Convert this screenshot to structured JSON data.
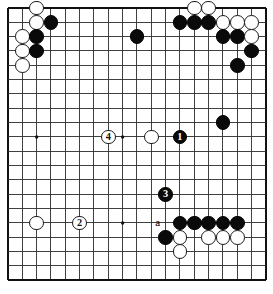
{
  "app": {
    "title": "Go board diagram",
    "type": "go-game-diagram"
  },
  "board": {
    "columns": 19,
    "rows": 20,
    "origin_x": 8,
    "origin_y": 8,
    "spacing": 14.33,
    "line_color": "#2b2b2b",
    "border_color": "#111111",
    "background_color": "#ffffff",
    "star_points": [
      {
        "col": 3,
        "row": 10
      },
      {
        "col": 9,
        "row": 10
      },
      {
        "col": 9,
        "row": 16
      }
    ]
  },
  "colors": {
    "black_stone": "#0a0a0a",
    "white_stone": "#ffffff",
    "stone_outline": "#1a1a1a",
    "label_on_black": "#ffffff",
    "label_on_white": "#111111"
  },
  "stones": [
    {
      "id": "w-c3r1",
      "color": "white",
      "col": 3,
      "row": 1,
      "label": ""
    },
    {
      "id": "w-c3r2",
      "color": "white",
      "col": 3,
      "row": 2,
      "label": ""
    },
    {
      "id": "b-c4r2",
      "color": "black",
      "col": 4,
      "row": 2,
      "label": ""
    },
    {
      "id": "w-c2r3",
      "color": "white",
      "col": 2,
      "row": 3,
      "label": ""
    },
    {
      "id": "b-c3r3",
      "color": "black",
      "col": 3,
      "row": 3,
      "label": ""
    },
    {
      "id": "w-c2r4",
      "color": "white",
      "col": 2,
      "row": 4,
      "label": ""
    },
    {
      "id": "b-c3r4",
      "color": "black",
      "col": 3,
      "row": 4,
      "label": ""
    },
    {
      "id": "w-c2r5",
      "color": "white",
      "col": 2,
      "row": 5,
      "label": ""
    },
    {
      "id": "b-c10r3",
      "color": "black",
      "col": 10,
      "row": 3,
      "label": ""
    },
    {
      "id": "w-c14r1",
      "color": "white",
      "col": 14,
      "row": 1,
      "label": ""
    },
    {
      "id": "w-c15r1",
      "color": "white",
      "col": 15,
      "row": 1,
      "label": ""
    },
    {
      "id": "b-c13r2",
      "color": "black",
      "col": 13,
      "row": 2,
      "label": ""
    },
    {
      "id": "b-c14r2",
      "color": "black",
      "col": 14,
      "row": 2,
      "label": ""
    },
    {
      "id": "b-c15r2",
      "color": "black",
      "col": 15,
      "row": 2,
      "label": ""
    },
    {
      "id": "w-c16r2",
      "color": "white",
      "col": 16,
      "row": 2,
      "label": ""
    },
    {
      "id": "w-c17r2",
      "color": "white",
      "col": 17,
      "row": 2,
      "label": ""
    },
    {
      "id": "w-c18r2",
      "color": "white",
      "col": 18,
      "row": 2,
      "label": ""
    },
    {
      "id": "b-c16r3",
      "color": "black",
      "col": 16,
      "row": 3,
      "label": ""
    },
    {
      "id": "b-c17r3",
      "color": "black",
      "col": 17,
      "row": 3,
      "label": ""
    },
    {
      "id": "w-c18r3",
      "color": "white",
      "col": 18,
      "row": 3,
      "label": ""
    },
    {
      "id": "b-c18r4",
      "color": "black",
      "col": 18,
      "row": 4,
      "label": ""
    },
    {
      "id": "b-c17r5",
      "color": "black",
      "col": 17,
      "row": 5,
      "label": ""
    },
    {
      "id": "b-c16r9",
      "color": "black",
      "col": 16,
      "row": 9,
      "label": ""
    },
    {
      "id": "w-c11r10",
      "color": "white",
      "col": 11,
      "row": 10,
      "label": ""
    },
    {
      "id": "b-c13r10",
      "color": "black",
      "col": 13,
      "row": 10,
      "label": "1"
    },
    {
      "id": "w-c8r10",
      "color": "white",
      "col": 8,
      "row": 10,
      "label": "4"
    },
    {
      "id": "b-c12r14",
      "color": "black",
      "col": 12,
      "row": 14,
      "label": "3"
    },
    {
      "id": "w-c3r16",
      "color": "white",
      "col": 3,
      "row": 16,
      "label": ""
    },
    {
      "id": "w-c6r16",
      "color": "white",
      "col": 6,
      "row": 16,
      "label": "2"
    },
    {
      "id": "b-c13r16",
      "color": "black",
      "col": 13,
      "row": 16,
      "label": ""
    },
    {
      "id": "b-c14r16",
      "color": "black",
      "col": 14,
      "row": 16,
      "label": ""
    },
    {
      "id": "b-c15r16",
      "color": "black",
      "col": 15,
      "row": 16,
      "label": ""
    },
    {
      "id": "b-c16r16",
      "color": "black",
      "col": 16,
      "row": 16,
      "label": ""
    },
    {
      "id": "b-c17r16",
      "color": "black",
      "col": 17,
      "row": 16,
      "label": ""
    },
    {
      "id": "b-c12r17",
      "color": "black",
      "col": 12,
      "row": 17,
      "label": ""
    },
    {
      "id": "w-c13r17",
      "color": "white",
      "col": 13,
      "row": 17,
      "label": ""
    },
    {
      "id": "w-c15r17",
      "color": "white",
      "col": 15,
      "row": 17,
      "label": ""
    },
    {
      "id": "w-c16r17",
      "color": "white",
      "col": 16,
      "row": 17,
      "label": ""
    },
    {
      "id": "w-c17r17",
      "color": "white",
      "col": 17,
      "row": 17,
      "label": ""
    },
    {
      "id": "w-c13r18",
      "color": "white",
      "col": 13,
      "row": 18,
      "label": ""
    }
  ],
  "markers": [
    {
      "id": "letter-a",
      "text": "a",
      "col": 12,
      "row": 16,
      "offset_x": -8,
      "offset_y": 0
    }
  ],
  "move_numbers": {
    "1": "black move one",
    "2": "white move two",
    "3": "black move three",
    "4": "white move four"
  }
}
